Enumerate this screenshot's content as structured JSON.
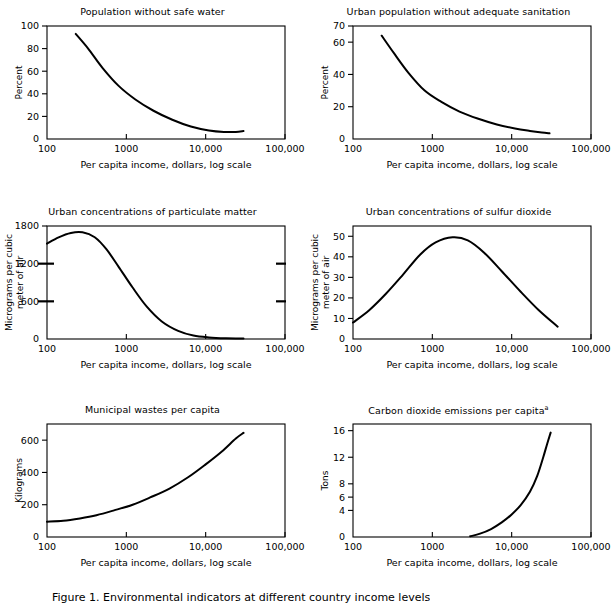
{
  "figure": {
    "caption": "Figure 1. Environmental indicators at different country income levels",
    "x_axis_label": "Per capita income, dollars, log scale",
    "x_ticks": [
      "100",
      "1000",
      "10,000",
      "100,000"
    ],
    "x_range": [
      100,
      100000
    ]
  },
  "chart_data": [
    {
      "type": "line",
      "title": "Population without safe water",
      "xlabel": "Per capita income, dollars, log scale",
      "ylabel": "Percent",
      "xscale": "log",
      "xlim": [
        100,
        100000
      ],
      "ylim": [
        0,
        100
      ],
      "yticks": [
        0,
        20,
        40,
        60,
        80,
        100
      ],
      "xticks": [
        100,
        1000,
        10000,
        100000
      ],
      "xticklabels": [
        "100",
        "1000",
        "10,000",
        "100,000"
      ],
      "grid": false,
      "x": [
        230,
        330,
        500,
        800,
        1300,
        2200,
        3800,
        6500,
        11000,
        17000,
        24000,
        30000
      ],
      "values": [
        93,
        80,
        63,
        47,
        35,
        25,
        17,
        11,
        7.5,
        6.2,
        6.3,
        7.0
      ]
    },
    {
      "type": "line",
      "title": "Urban population without adequate sanitation",
      "xlabel": "Per capita income, dollars, log scale",
      "ylabel": "Percent",
      "xscale": "log",
      "xlim": [
        100,
        100000
      ],
      "ylim": [
        0,
        70
      ],
      "yticks": [
        0,
        20,
        40,
        60,
        70
      ],
      "xticks": [
        100,
        1000,
        10000,
        100000
      ],
      "xticklabels": [
        "100",
        "1000",
        "10,000",
        "100,000"
      ],
      "grid": false,
      "x": [
        230,
        330,
        500,
        800,
        1300,
        2200,
        3800,
        6500,
        11000,
        17000,
        24000,
        30000
      ],
      "values": [
        64,
        53,
        41,
        30,
        23,
        17,
        12.5,
        9,
        6.5,
        5.0,
        4.0,
        3.5
      ]
    },
    {
      "type": "line",
      "title": "Urban concentrations of particulate matter",
      "xlabel": "Per capita income, dollars, log scale",
      "ylabel": "Micrograms per cubic meter of air",
      "xscale": "log",
      "xlim": [
        100,
        100000
      ],
      "ylim": [
        0,
        1800
      ],
      "yticks": [
        0,
        600,
        1200,
        1800
      ],
      "xticks": [
        100,
        1000,
        10000,
        100000
      ],
      "xticklabels": [
        "100",
        "1000",
        "10,000",
        "100,000"
      ],
      "grid": false,
      "x": [
        100,
        140,
        200,
        280,
        400,
        560,
        800,
        1200,
        1800,
        2800,
        4500,
        7000,
        11000,
        18000,
        30000
      ],
      "values": [
        1520,
        1620,
        1690,
        1700,
        1620,
        1430,
        1150,
        820,
        520,
        280,
        130,
        55,
        25,
        12,
        8
      ]
    },
    {
      "type": "line",
      "title": "Urban concentrations of sulfur dioxide",
      "xlabel": "Per capita income, dollars, log scale",
      "ylabel": "Micrograms per cubic meter of air",
      "xscale": "log",
      "xlim": [
        100,
        100000
      ],
      "ylim": [
        0,
        55
      ],
      "yticks": [
        0,
        10,
        20,
        30,
        40,
        50
      ],
      "xticks": [
        100,
        1000,
        10000,
        100000
      ],
      "xticklabels": [
        "100",
        "1000",
        "10,000",
        "100,000"
      ],
      "grid": false,
      "x": [
        100,
        160,
        260,
        420,
        700,
        1100,
        1800,
        2800,
        4500,
        7500,
        13000,
        22000,
        38000
      ],
      "values": [
        8,
        14,
        22,
        31,
        41,
        47,
        49.5,
        48,
        42,
        33,
        23,
        14,
        6
      ]
    },
    {
      "type": "line",
      "title": "Municipal wastes per capita",
      "xlabel": "Per capita income, dollars, log scale",
      "ylabel": "Kilograms",
      "xscale": "log",
      "xlim": [
        100,
        100000
      ],
      "ylim": [
        0,
        700
      ],
      "yticks": [
        0,
        200,
        400,
        600
      ],
      "xticks": [
        100,
        1000,
        10000,
        100000
      ],
      "xticklabels": [
        "100",
        "1000",
        "10,000",
        "100,000"
      ],
      "grid": false,
      "x": [
        100,
        160,
        260,
        420,
        700,
        1200,
        2000,
        3500,
        6000,
        10000,
        16000,
        24000,
        30000
      ],
      "values": [
        95,
        100,
        115,
        135,
        165,
        200,
        245,
        300,
        370,
        450,
        530,
        610,
        645
      ]
    },
    {
      "type": "line",
      "title": "Carbon dioxide emissions per capita",
      "title_superscript": "a",
      "xlabel": "Per capita income, dollars, log scale",
      "ylabel": "Tons",
      "xscale": "log",
      "xlim": [
        100,
        100000
      ],
      "ylim": [
        0,
        17
      ],
      "yticks": [
        0,
        4,
        6,
        8,
        12,
        16
      ],
      "xticks": [
        100,
        1000,
        10000,
        100000
      ],
      "xticklabels": [
        "100",
        "1000",
        "10,000",
        "100,000"
      ],
      "grid": false,
      "x": [
        3000,
        4000,
        5500,
        7500,
        10000,
        13000,
        17000,
        21000,
        25000,
        28000,
        31000
      ],
      "values": [
        0.1,
        0.5,
        1.2,
        2.2,
        3.4,
        4.8,
        6.8,
        9.2,
        12.0,
        14.0,
        15.7
      ]
    }
  ]
}
